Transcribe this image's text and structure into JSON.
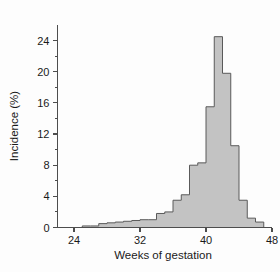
{
  "chart_data": {
    "type": "bar",
    "title": "",
    "subtitle": "",
    "xlabel": "Weeks of gestation",
    "ylabel": "Incidence (%)",
    "xlim": [
      22,
      48
    ],
    "ylim": [
      0,
      26
    ],
    "grid": false,
    "legend": null,
    "bin_width": 1,
    "x_ticks": [
      24,
      32,
      40,
      48
    ],
    "x_tick_labels": [
      "24",
      "32",
      "40",
      "48"
    ],
    "y_ticks": [
      0,
      4,
      8,
      12,
      16,
      20,
      24
    ],
    "y_tick_labels": [
      "0",
      "4",
      "8",
      "12",
      "16",
      "20",
      "24"
    ],
    "y_minor_ticks": [
      2,
      6,
      10,
      14,
      18,
      22
    ],
    "categories": [
      22,
      23,
      24,
      25,
      26,
      27,
      28,
      29,
      30,
      31,
      32,
      33,
      34,
      35,
      36,
      37,
      38,
      39,
      40,
      41,
      42,
      43,
      44,
      45,
      46
    ],
    "values": [
      0,
      0,
      0,
      0.2,
      0.2,
      0.5,
      0.6,
      0.7,
      0.8,
      0.9,
      1.0,
      1.0,
      1.8,
      2.0,
      3.5,
      4.2,
      8.0,
      8.3,
      15.5,
      24.5,
      19.8,
      10.5,
      3.5,
      1.2,
      0.7
    ],
    "series": [
      {
        "name": "Incidence",
        "values": [
          0,
          0,
          0,
          0.2,
          0.2,
          0.5,
          0.6,
          0.7,
          0.8,
          0.9,
          1.0,
          1.0,
          1.8,
          2.0,
          3.5,
          4.2,
          8.0,
          8.3,
          15.5,
          24.5,
          19.8,
          10.5,
          3.5,
          1.2,
          0.7
        ]
      }
    ],
    "peak": {
      "week": 40,
      "value": 24.5
    },
    "colors": {
      "bar_fill": "#c3c3c3",
      "bar_stroke": "#5a5a5a",
      "axis": "#4d4d4d",
      "text": "#1a1a1a",
      "background": "#fdfdfd"
    }
  },
  "axes": {
    "x_title": "Weeks of gestation",
    "y_title": "Incidence (%)"
  }
}
